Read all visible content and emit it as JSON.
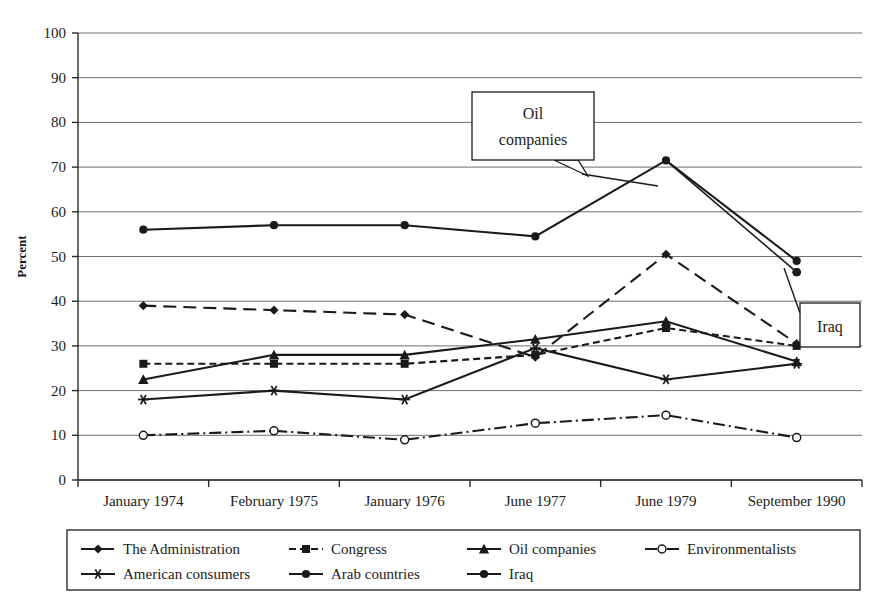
{
  "chart_data": {
    "type": "line",
    "title": "",
    "xlabel": "",
    "ylabel": "Percent",
    "ylim": [
      0,
      100
    ],
    "ytick_step": 10,
    "grid": true,
    "legend_position": "bottom",
    "categories": [
      "January 1974",
      "February 1975",
      "January 1976",
      "June 1977",
      "June 1979",
      "September 1990"
    ],
    "yticks": [
      "0",
      "10",
      "20",
      "30",
      "40",
      "50",
      "60",
      "70",
      "80",
      "90",
      "100"
    ],
    "series": [
      {
        "name": "The Administration",
        "marker": "diamond",
        "line": "dashed",
        "values": [
          39,
          38,
          37,
          27.5,
          50.5,
          30.5
        ]
      },
      {
        "name": "Congress",
        "marker": "square",
        "line": "dotted-dash",
        "values": [
          26,
          26,
          26,
          28,
          34,
          30
        ]
      },
      {
        "name": "Oil companies",
        "marker": "triangle",
        "line": "solid",
        "values": [
          22.5,
          28,
          28,
          31.5,
          35.5,
          26.5
        ]
      },
      {
        "name": "Environmentalists",
        "marker": "open-circle",
        "line": "dash-dot",
        "values": [
          10,
          11,
          9,
          12.7,
          14.5,
          9.5
        ]
      },
      {
        "name": "American consumers",
        "marker": "star",
        "line": "solid",
        "values": [
          18,
          20,
          18,
          29.5,
          22.5,
          26
        ]
      },
      {
        "name": "Arab countries",
        "marker": "filled-circle",
        "line": "solid",
        "values": [
          56,
          57,
          57,
          54.5,
          71.5,
          49
        ]
      },
      {
        "name": "Iraq",
        "marker": "filled-circle",
        "line": "solid",
        "values": [
          null,
          null,
          null,
          null,
          null,
          46.5
        ]
      }
    ],
    "annotations": [
      {
        "text": "Oil companies",
        "text_line1": "Oil",
        "text_line2": "companies"
      },
      {
        "text": "Iraq",
        "text_line1": "Iraq",
        "text_line2": ""
      }
    ]
  },
  "legend": {
    "entries": [
      {
        "label": "The Administration",
        "marker": "diamond",
        "line": "dashed"
      },
      {
        "label": "Congress",
        "marker": "square",
        "line": "dotted-dash"
      },
      {
        "label": "Oil companies",
        "marker": "triangle",
        "line": "solid"
      },
      {
        "label": "Environmentalists",
        "marker": "open-circle",
        "line": "dash-dot"
      },
      {
        "label": "American consumers",
        "marker": "star",
        "line": "solid"
      },
      {
        "label": "Arab countries",
        "marker": "filled-circle",
        "line": "solid"
      },
      {
        "label": "Iraq",
        "marker": "filled-circle",
        "line": "solid"
      }
    ]
  },
  "colors": {
    "ink": "#1a1a1a",
    "grid": "#6e6e6e",
    "background": "#ffffff"
  }
}
